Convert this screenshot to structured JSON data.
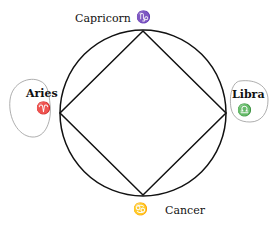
{
  "diagram": {
    "signs": [
      {
        "name": "Capricorn",
        "symbol": "♑",
        "position": "top"
      },
      {
        "name": "Aries",
        "symbol": "♈",
        "position": "left",
        "circled": true
      },
      {
        "name": "Libra",
        "symbol": "♎",
        "position": "right",
        "circled": true
      },
      {
        "name": "Cancer",
        "symbol": "♋",
        "position": "bottom"
      }
    ]
  }
}
